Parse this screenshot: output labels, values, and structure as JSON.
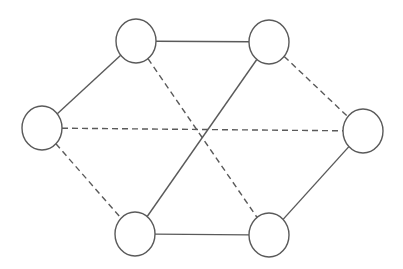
{
  "diagram": {
    "type": "graph",
    "colors": {
      "stroke": "#5a5a5a",
      "node_fill": "#ffffff",
      "background": "#ffffff"
    },
    "nodes": [
      {
        "id": "top-left",
        "cx": 136,
        "cy": 41,
        "rx": 20,
        "ry": 22
      },
      {
        "id": "top-right",
        "cx": 269,
        "cy": 42,
        "rx": 20,
        "ry": 22
      },
      {
        "id": "left",
        "cx": 42,
        "cy": 128,
        "rx": 20,
        "ry": 22
      },
      {
        "id": "right",
        "cx": 363,
        "cy": 131,
        "rx": 20,
        "ry": 22
      },
      {
        "id": "bottom-left",
        "cx": 135,
        "cy": 234,
        "rx": 20,
        "ry": 22
      },
      {
        "id": "bottom-right",
        "cx": 269,
        "cy": 235,
        "rx": 20,
        "ry": 22
      }
    ],
    "edges": [
      {
        "from": "top-left",
        "to": "top-right",
        "style": "solid"
      },
      {
        "from": "left",
        "to": "top-left",
        "style": "solid"
      },
      {
        "from": "top-right",
        "to": "bottom-left",
        "style": "solid"
      },
      {
        "from": "bottom-left",
        "to": "bottom-right",
        "style": "solid"
      },
      {
        "from": "bottom-right",
        "to": "right",
        "style": "solid"
      },
      {
        "from": "top-left",
        "to": "bottom-right",
        "style": "dashed"
      },
      {
        "from": "left",
        "to": "right",
        "style": "dashed"
      },
      {
        "from": "left",
        "to": "bottom-left",
        "style": "dashed"
      },
      {
        "from": "top-right",
        "to": "right",
        "style": "dashed"
      }
    ]
  }
}
